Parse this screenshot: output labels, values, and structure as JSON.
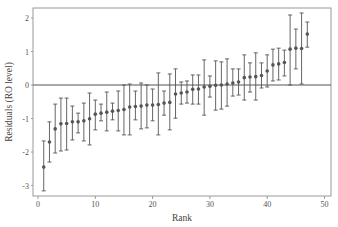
{
  "chart_data": {
    "type": "scatter",
    "subtype": "caterpillar plot with error bars",
    "title": "",
    "xlabel": "Rank",
    "ylabel": "Residuals (RO level)",
    "xlim": [
      -1,
      51
    ],
    "ylim": [
      -3.3,
      2.3
    ],
    "xticks": [
      0,
      10,
      20,
      30,
      40,
      50
    ],
    "yticks": [
      -3,
      -2,
      -1,
      0,
      1,
      2
    ],
    "grid": false,
    "reference_line": 0,
    "legend": null,
    "x": [
      1,
      2,
      3,
      4,
      5,
      6,
      7,
      8,
      9,
      10,
      11,
      12,
      13,
      14,
      15,
      16,
      17,
      18,
      19,
      20,
      21,
      22,
      23,
      24,
      25,
      26,
      27,
      28,
      29,
      30,
      31,
      32,
      33,
      34,
      35,
      36,
      37,
      38,
      39,
      40,
      41,
      42,
      43,
      44,
      45,
      46,
      47
    ],
    "values": [
      -2.45,
      -1.7,
      -1.31,
      -1.16,
      -1.15,
      -1.1,
      -1.1,
      -1.07,
      -1.01,
      -0.87,
      -0.84,
      -0.81,
      -0.78,
      -0.76,
      -0.73,
      -0.66,
      -0.64,
      -0.63,
      -0.6,
      -0.6,
      -0.58,
      -0.54,
      -0.52,
      -0.27,
      -0.24,
      -0.21,
      -0.13,
      -0.12,
      -0.06,
      -0.04,
      -0.01,
      0.0,
      0.03,
      0.06,
      0.09,
      0.22,
      0.24,
      0.25,
      0.28,
      0.42,
      0.6,
      0.63,
      0.67,
      1.07,
      1.1,
      1.09,
      1.52
    ],
    "upper": [
      -1.67,
      -1.1,
      -0.57,
      -0.39,
      -0.39,
      -0.63,
      -0.84,
      -0.54,
      -0.24,
      -0.45,
      -0.57,
      -0.21,
      -0.54,
      -0.18,
      0.0,
      0.03,
      -0.18,
      0.06,
      0.0,
      -0.12,
      0.36,
      -0.18,
      0.33,
      0.48,
      0.09,
      0.12,
      0.3,
      0.3,
      0.75,
      0.27,
      0.72,
      0.69,
      0.78,
      0.48,
      0.48,
      0.9,
      0.66,
      0.96,
      0.66,
      0.9,
      1.07,
      1.1,
      1.04,
      2.09,
      1.67,
      2.15,
      1.88
    ],
    "lower": [
      -3.16,
      -2.3,
      -2.03,
      -1.97,
      -1.94,
      -1.64,
      -1.43,
      -1.67,
      -1.79,
      -1.34,
      -1.07,
      -1.37,
      -1.04,
      -1.37,
      -1.49,
      -1.49,
      -1.04,
      -1.31,
      -1.28,
      -1.07,
      -1.49,
      -0.9,
      -1.34,
      -0.99,
      -0.57,
      -0.54,
      -0.57,
      -0.57,
      -0.9,
      -0.36,
      -0.75,
      -0.72,
      -0.63,
      -0.33,
      -0.3,
      -0.45,
      -0.21,
      -0.45,
      -0.09,
      -0.06,
      0.12,
      0.15,
      0.27,
      0.0,
      0.48,
      0.03,
      1.13
    ]
  },
  "colors": {
    "frame": "#9a9a9a",
    "zero_line": "#555555",
    "marker": "#555555",
    "error_bar": "#555555",
    "text": "#555555"
  }
}
